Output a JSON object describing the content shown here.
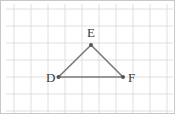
{
  "figure": {
    "type": "geometry-diagram",
    "canvas": {
      "width": 175,
      "height": 114
    },
    "border_color": "#c8c8c8",
    "background_color": "#ffffff"
  },
  "grid": {
    "line_color": "#d8d8d8",
    "line_width": 0.8,
    "spacing": 17,
    "vertical_lines_x": [
      13,
      30,
      47,
      64,
      81,
      98,
      115,
      132,
      149,
      166
    ],
    "horizontal_lines_y": [
      8,
      25,
      42,
      59,
      76,
      93,
      110
    ],
    "x_start": 5,
    "x_end": 172,
    "y_start": 3,
    "y_end": 112
  },
  "triangle": {
    "name": "DEF",
    "edge_color": "#7a7a7a",
    "edge_width": 1.6,
    "vertex_dot_color": "#555555",
    "vertex_dot_radius": 2.0,
    "vertices": [
      {
        "label": "D",
        "x": 57.5,
        "y": 76,
        "label_x": 45,
        "label_y": 80.5,
        "label_anchor": "start"
      },
      {
        "label": "E",
        "x": 90,
        "y": 44,
        "label_x": 90,
        "label_y": 36,
        "label_anchor": "middle"
      },
      {
        "label": "F",
        "x": 122,
        "y": 76,
        "label_x": 127,
        "label_y": 80.5,
        "label_anchor": "start"
      }
    ],
    "edges": [
      {
        "name": "edge-DE",
        "from": "D",
        "to": "E"
      },
      {
        "name": "edge-EF",
        "from": "E",
        "to": "F"
      },
      {
        "name": "edge-DF",
        "from": "D",
        "to": "F"
      }
    ]
  }
}
